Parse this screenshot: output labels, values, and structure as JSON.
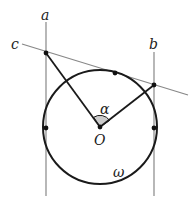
{
  "diagram": {
    "type": "geometry",
    "labels": {
      "line_a": "a",
      "line_b": "b",
      "line_c": "c",
      "angle": "α",
      "center": "O",
      "circle": "ω"
    },
    "colors": {
      "thin_line": "#888888",
      "thick_line": "#1a1a1a",
      "angle_fill": "#cccccc"
    },
    "circle": {
      "cx": 100,
      "cy": 127,
      "r": 57
    },
    "points": [
      {
        "name": "A",
        "x": 46,
        "y": 53
      },
      {
        "name": "T",
        "x": 115,
        "y": 73
      },
      {
        "name": "B",
        "x": 154,
        "y": 85
      },
      {
        "name": "O",
        "x": 100,
        "y": 127
      },
      {
        "name": "L",
        "x": 46,
        "y": 128
      },
      {
        "name": "R",
        "x": 154,
        "y": 128
      }
    ]
  }
}
